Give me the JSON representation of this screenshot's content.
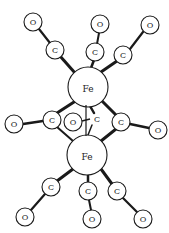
{
  "diagram": {
    "title": "",
    "labels": {
      "iron": "Fe",
      "carbon": "C",
      "oxygen": "O"
    },
    "atoms": [
      {
        "id": "fe1",
        "element": "Fe",
        "x": 88,
        "y": 87,
        "r": 20
      },
      {
        "id": "fe2",
        "element": "Fe",
        "x": 87,
        "y": 155,
        "r": 20
      },
      {
        "id": "c1",
        "element": "C",
        "x": 55,
        "y": 50,
        "r": 9
      },
      {
        "id": "o1",
        "element": "O",
        "x": 33,
        "y": 22,
        "r": 9
      },
      {
        "id": "c2",
        "element": "C",
        "x": 95,
        "y": 52,
        "r": 9
      },
      {
        "id": "o2",
        "element": "O",
        "x": 100,
        "y": 24,
        "r": 9
      },
      {
        "id": "c3",
        "element": "C",
        "x": 123,
        "y": 55,
        "r": 9
      },
      {
        "id": "o3",
        "element": "O",
        "x": 150,
        "y": 25,
        "r": 9
      },
      {
        "id": "c4",
        "element": "C",
        "x": 52,
        "y": 120,
        "r": 9
      },
      {
        "id": "o4",
        "element": "O",
        "x": 14,
        "y": 124,
        "r": 9
      },
      {
        "id": "c5",
        "element": "C",
        "x": 96,
        "y": 119,
        "r": 7
      },
      {
        "id": "o5",
        "element": "O",
        "x": 73,
        "y": 122,
        "r": 9
      },
      {
        "id": "c6",
        "element": "C",
        "x": 121,
        "y": 122,
        "r": 9
      },
      {
        "id": "o6",
        "element": "O",
        "x": 158,
        "y": 130,
        "r": 9
      },
      {
        "id": "c7",
        "element": "C",
        "x": 51,
        "y": 187,
        "r": 9
      },
      {
        "id": "o7",
        "element": "O",
        "x": 25,
        "y": 217,
        "r": 9
      },
      {
        "id": "c8",
        "element": "C",
        "x": 88,
        "y": 191,
        "r": 9
      },
      {
        "id": "o8",
        "element": "O",
        "x": 92,
        "y": 219,
        "r": 9
      },
      {
        "id": "c9",
        "element": "C",
        "x": 117,
        "y": 191,
        "r": 9
      },
      {
        "id": "o9",
        "element": "O",
        "x": 143,
        "y": 219,
        "r": 9
      }
    ],
    "bonds": [
      [
        "fe1",
        "c1"
      ],
      [
        "c1",
        "o1"
      ],
      [
        "fe1",
        "c2"
      ],
      [
        "c2",
        "o2"
      ],
      [
        "fe1",
        "c3"
      ],
      [
        "c3",
        "o3"
      ],
      [
        "fe1",
        "c4"
      ],
      [
        "fe1",
        "c5"
      ],
      [
        "fe1",
        "c6"
      ],
      [
        "fe2",
        "c4"
      ],
      [
        "fe2",
        "c5"
      ],
      [
        "fe2",
        "c6"
      ],
      [
        "c4",
        "o4"
      ],
      [
        "c5",
        "o5"
      ],
      [
        "c6",
        "o6"
      ],
      [
        "fe2",
        "c7"
      ],
      [
        "c7",
        "o7"
      ],
      [
        "fe2",
        "c8"
      ],
      [
        "c8",
        "o8"
      ],
      [
        "fe2",
        "c9"
      ],
      [
        "c9",
        "o9"
      ]
    ],
    "colors": {
      "stroke": "#1a1a1a",
      "fill": "#ffffff",
      "background": "#ffffff"
    }
  }
}
